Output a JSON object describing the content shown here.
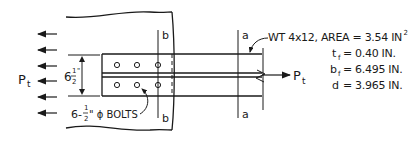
{
  "diagram": {
    "colors": {
      "line": "#1a1a1a",
      "background": "#ffffff"
    },
    "load_label": {
      "main": "P",
      "sub": "t"
    },
    "gusset_height_dim": {
      "whole": "6",
      "frac_num": "1",
      "frac_den": "2",
      "unit": "\""
    },
    "bolts_label": {
      "prefix": "6-",
      "frac_num": "1",
      "frac_den": "2",
      "suffix": "\" ϕ BOLTS"
    },
    "section_b_label": "b",
    "section_a_label": "a",
    "member": {
      "designation": "WT 4x12, AREA = 3.54 IN",
      "area_exponent": "2",
      "properties": [
        {
          "symbol": "t",
          "sub": "f",
          "value": "= 0.40 IN."
        },
        {
          "symbol": "b",
          "sub": "f",
          "value": "= 6.495 IN."
        },
        {
          "symbol": "d",
          "sub": "",
          "value": "= 3.965 IN."
        }
      ]
    },
    "left_arrow_count": 6,
    "bolt_rows": 2,
    "bolt_columns": 3
  }
}
